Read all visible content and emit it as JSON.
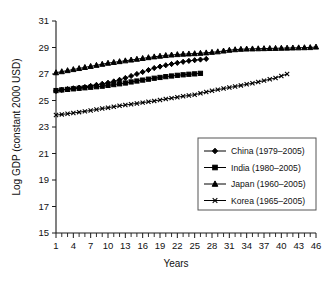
{
  "chart_data": {
    "type": "line",
    "title": "",
    "xlabel": "Years",
    "ylabel": "Log GDP (constant 2000 USD)",
    "xlim": [
      1,
      46
    ],
    "ylim": [
      15,
      31
    ],
    "ytick_step": 2,
    "xtick_step": 3,
    "grid": false,
    "legend_position": "bottom-right",
    "yticks": [
      15,
      17,
      19,
      21,
      23,
      25,
      27,
      29,
      31
    ],
    "xticks": [
      1,
      4,
      7,
      10,
      13,
      16,
      19,
      22,
      25,
      28,
      31,
      34,
      37,
      40,
      43,
      46
    ],
    "series": [
      {
        "name": "China (1979–2005)",
        "marker": "diamond",
        "x": [
          1,
          2,
          3,
          4,
          5,
          6,
          7,
          8,
          9,
          10,
          11,
          12,
          13,
          14,
          15,
          16,
          17,
          18,
          19,
          20,
          21,
          22,
          23,
          24,
          25,
          26,
          27
        ],
        "values": [
          25.72,
          25.8,
          25.86,
          25.92,
          25.97,
          26.02,
          26.1,
          26.18,
          26.26,
          26.34,
          26.44,
          26.56,
          26.7,
          26.85,
          27.0,
          27.15,
          27.3,
          27.45,
          27.56,
          27.66,
          27.75,
          27.84,
          27.92,
          27.99,
          28.04,
          28.09,
          28.14
        ]
      },
      {
        "name": "India (1980–2005)",
        "marker": "square",
        "x": [
          1,
          2,
          3,
          4,
          5,
          6,
          7,
          8,
          9,
          10,
          11,
          12,
          13,
          14,
          15,
          16,
          17,
          18,
          19,
          20,
          21,
          22,
          23,
          24,
          25,
          26
        ],
        "values": [
          25.75,
          25.8,
          25.84,
          25.88,
          25.92,
          25.96,
          26.0,
          26.04,
          26.08,
          26.14,
          26.2,
          26.26,
          26.32,
          26.4,
          26.47,
          26.54,
          26.61,
          26.68,
          26.74,
          26.8,
          26.85,
          26.9,
          26.94,
          26.98,
          27.01,
          27.05
        ]
      },
      {
        "name": "Japan (1960–2005)",
        "marker": "triangle",
        "x": [
          1,
          2,
          3,
          4,
          5,
          6,
          7,
          8,
          9,
          10,
          11,
          12,
          13,
          14,
          15,
          16,
          17,
          18,
          19,
          20,
          21,
          22,
          23,
          24,
          25,
          26,
          27,
          28,
          29,
          30,
          31,
          32,
          33,
          34,
          35,
          36,
          37,
          38,
          39,
          40,
          41,
          42,
          43,
          44,
          45,
          46
        ],
        "values": [
          27.1,
          27.18,
          27.26,
          27.34,
          27.42,
          27.5,
          27.58,
          27.66,
          27.74,
          27.82,
          27.88,
          27.94,
          28.0,
          28.06,
          28.12,
          28.18,
          28.24,
          28.3,
          28.35,
          28.4,
          28.44,
          28.47,
          28.5,
          28.52,
          28.54,
          28.57,
          28.6,
          28.64,
          28.68,
          28.74,
          28.8,
          28.84,
          28.87,
          28.89,
          28.9,
          28.91,
          28.92,
          28.93,
          28.94,
          28.95,
          28.96,
          28.97,
          28.98,
          28.99,
          29.0,
          29.04
        ]
      },
      {
        "name": "Korea (1965–2005)",
        "marker": "cross",
        "x": [
          1,
          2,
          3,
          4,
          5,
          6,
          7,
          8,
          9,
          10,
          11,
          12,
          13,
          14,
          15,
          16,
          17,
          18,
          19,
          20,
          21,
          22,
          23,
          24,
          25,
          26,
          27,
          28,
          29,
          30,
          31,
          32,
          33,
          34,
          35,
          36,
          37,
          38,
          39,
          40,
          41
        ],
        "values": [
          23.9,
          23.95,
          24.0,
          24.06,
          24.12,
          24.18,
          24.25,
          24.32,
          24.39,
          24.46,
          24.53,
          24.6,
          24.66,
          24.72,
          24.78,
          24.84,
          24.9,
          24.97,
          25.04,
          25.11,
          25.18,
          25.25,
          25.32,
          25.38,
          25.44,
          25.54,
          25.64,
          25.73,
          25.82,
          25.9,
          25.98,
          26.06,
          26.14,
          26.22,
          26.3,
          26.4,
          26.5,
          26.6,
          26.7,
          26.85,
          27.0
        ]
      }
    ]
  },
  "legend": {
    "items": [
      {
        "label": "China (1979–2005)",
        "marker": "diamond"
      },
      {
        "label": "India (1980–2005)",
        "marker": "square"
      },
      {
        "label": "Japan (1960–2005)",
        "marker": "triangle"
      },
      {
        "label": "Korea (1965–2005)",
        "marker": "cross"
      }
    ]
  },
  "colors": {
    "series": "#000000",
    "axis": "#1a1a1a",
    "legend_border": "#555555",
    "background": "#ffffff"
  }
}
